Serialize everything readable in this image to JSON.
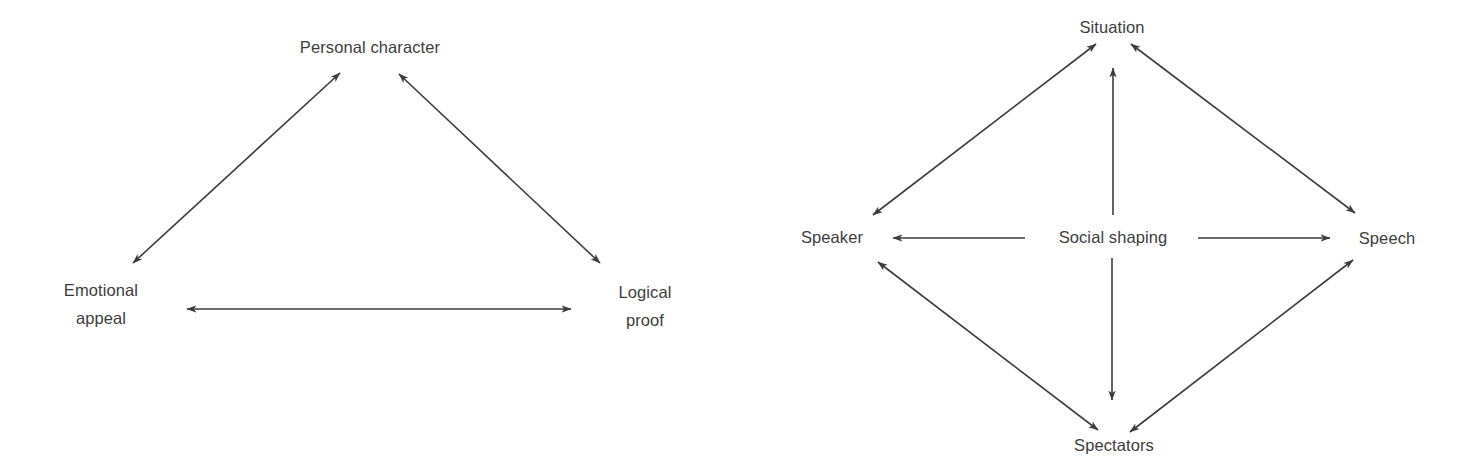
{
  "figure": {
    "background": "#ffffff",
    "ink_color": "#3d3d3d"
  },
  "diagrams": [
    {
      "id": "rhetorical-triangle",
      "nodes": [
        {
          "id": "personal_character",
          "label": "Personal character"
        },
        {
          "id": "emotional_appeal",
          "label": "Emotional appeal"
        },
        {
          "id": "logical_proof",
          "label": "Logical proof"
        }
      ],
      "edges": [
        {
          "from": "personal_character",
          "to": "emotional_appeal",
          "arrows": "both"
        },
        {
          "from": "personal_character",
          "to": "logical_proof",
          "arrows": "both"
        },
        {
          "from": "emotional_appeal",
          "to": "logical_proof",
          "arrows": "both"
        }
      ]
    },
    {
      "id": "social-shaping-diamond",
      "nodes": [
        {
          "id": "situation",
          "label": "Situation"
        },
        {
          "id": "speaker",
          "label": "Speaker"
        },
        {
          "id": "speech",
          "label": "Speech"
        },
        {
          "id": "spectators",
          "label": "Spectators"
        },
        {
          "id": "social_shaping",
          "label": "Social shaping"
        }
      ],
      "edges": [
        {
          "from": "situation",
          "to": "speaker",
          "arrows": "both"
        },
        {
          "from": "situation",
          "to": "speech",
          "arrows": "both"
        },
        {
          "from": "speaker",
          "to": "spectators",
          "arrows": "both"
        },
        {
          "from": "speech",
          "to": "spectators",
          "arrows": "both"
        },
        {
          "from": "social_shaping",
          "to": "situation",
          "arrows": "end"
        },
        {
          "from": "social_shaping",
          "to": "spectators",
          "arrows": "end"
        },
        {
          "from": "social_shaping",
          "to": "speaker",
          "arrows": "end"
        },
        {
          "from": "social_shaping",
          "to": "speech",
          "arrows": "end"
        }
      ]
    }
  ]
}
